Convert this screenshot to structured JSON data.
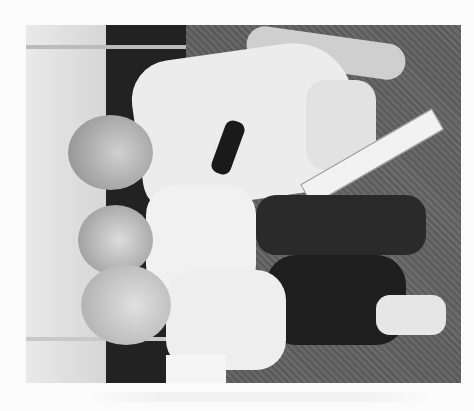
{
  "image": {
    "description": "Black-and-white photograph, rotated 90 degrees, of a man, a young child and a woman sitting on grass in front of a marquee tent, with a cricket bat",
    "shirt_logo_text": "MERRYDOWN",
    "orientation": "rotated-90",
    "colors": {
      "border": "#fbfbfb",
      "grass": "#5c5c5c",
      "tent": "#e0e0e0"
    }
  }
}
